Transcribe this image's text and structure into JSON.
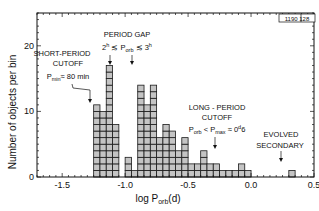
{
  "figure_id": "1190 128",
  "chart_data": {
    "type": "bar",
    "title": "",
    "xlabel": "log P_orb (d)",
    "ylabel": "Number of objects per bin",
    "xlim": [
      -1.7,
      0.5
    ],
    "ylim": [
      0,
      25
    ],
    "bin_width": 0.05,
    "x_ticks": [
      "-1.5",
      "-1.0",
      "-0.5",
      "0.0",
      "0.5"
    ],
    "x_tick_values": [
      -1.5,
      -1.0,
      -0.5,
      0.0,
      0.5
    ],
    "y_ticks": [
      "0",
      "10",
      "20"
    ],
    "y_tick_values": [
      0,
      10,
      20
    ],
    "grid": false,
    "bins": [
      {
        "x": -1.25,
        "count": 11
      },
      {
        "x": -1.2,
        "count": 10
      },
      {
        "x": -1.15,
        "count": 17
      },
      {
        "x": -1.1,
        "count": 8
      },
      {
        "x": -1.0,
        "count": 3
      },
      {
        "x": -0.95,
        "count": 1
      },
      {
        "x": -0.9,
        "count": 14
      },
      {
        "x": -0.85,
        "count": 11
      },
      {
        "x": -0.8,
        "count": 14
      },
      {
        "x": -0.75,
        "count": 6
      },
      {
        "x": -0.7,
        "count": 8
      },
      {
        "x": -0.65,
        "count": 7
      },
      {
        "x": -0.6,
        "count": 4
      },
      {
        "x": -0.55,
        "count": 6
      },
      {
        "x": -0.5,
        "count": 2
      },
      {
        "x": -0.45,
        "count": 2
      },
      {
        "x": -0.4,
        "count": 4
      },
      {
        "x": -0.35,
        "count": 2
      },
      {
        "x": -0.3,
        "count": 2
      },
      {
        "x": -0.25,
        "count": 1
      },
      {
        "x": -0.2,
        "count": 1
      },
      {
        "x": -0.15,
        "count": 1
      },
      {
        "x": -0.1,
        "count": 2
      },
      {
        "x": -0.05,
        "count": 1
      },
      {
        "x": 0.3,
        "count": 1
      }
    ],
    "annotations": [
      {
        "id": "short",
        "lines": [
          "SHORT-PERIOD",
          "CUTOFF",
          "P_min ≈ 80 min"
        ],
        "arrow_to_x": -1.22
      },
      {
        "id": "gap",
        "lines": [
          "PERIOD GAP",
          "2h ≲ P_orb ≲ 3h"
        ],
        "arrows_to_x": [
          -1.08,
          -0.91
        ]
      },
      {
        "id": "long",
        "lines": [
          "LONG-PERIOD",
          "CUTOFF",
          "P_orb < P_max ≈ 0.6 d"
        ],
        "arrow_to_x": -0.22
      },
      {
        "id": "evolved",
        "lines": [
          "EVOLVED",
          "SECONDARY"
        ],
        "arrow_to_x": 0.32
      }
    ]
  },
  "labels": {
    "ylabel": "Number of objects per bin",
    "xlabel_main": "log P",
    "xlabel_sub": "orb",
    "xlabel_tail": "(d)",
    "short_l1": "SHORT-PERIOD",
    "short_l2": "CUTOFF",
    "short_l3_main": "P",
    "short_l3_sub": "min",
    "short_l3_tail": "≈ 80 min",
    "gap_l1": "PERIOD GAP",
    "gap_l2_a": "2",
    "gap_l2_a_sup": "h",
    "gap_l2_b": " ≲ P",
    "gap_l2_b_sub": "orb",
    "gap_l2_c": " ≲ 3",
    "gap_l2_c_sup": "h",
    "long_l1": "LONG - PERIOD",
    "long_l2": "CUTOFF",
    "long_l3_a": "P",
    "long_l3_a_sub": "orb",
    "long_l3_b": " < P",
    "long_l3_b_sub": "max",
    "long_l3_c": " ≈ 0",
    "long_l3_c_sup": "d",
    "long_l3_d": "6",
    "evolved_l1": "EVOLVED",
    "evolved_l2": "SECONDARY",
    "corner_id": "1190 128"
  },
  "colors": {
    "bar_fill": "#c4c4c4",
    "bar_stroke": "#1a1a1a",
    "axis": "#111111",
    "text": "#111111"
  }
}
